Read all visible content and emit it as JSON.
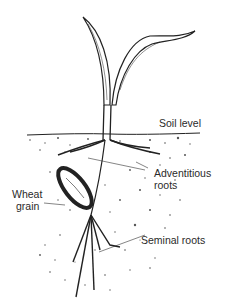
{
  "diagram": {
    "colors": {
      "ink": "#222222",
      "background": "#ffffff",
      "soil_dots": "#555555"
    },
    "labels": {
      "soil_level": "Soil level",
      "adventitious_line1": "Adventitious",
      "adventitious_line2": "roots",
      "wheat_line1": "Wheat",
      "wheat_line2": "grain",
      "seminal_roots": "Seminal roots"
    }
  }
}
